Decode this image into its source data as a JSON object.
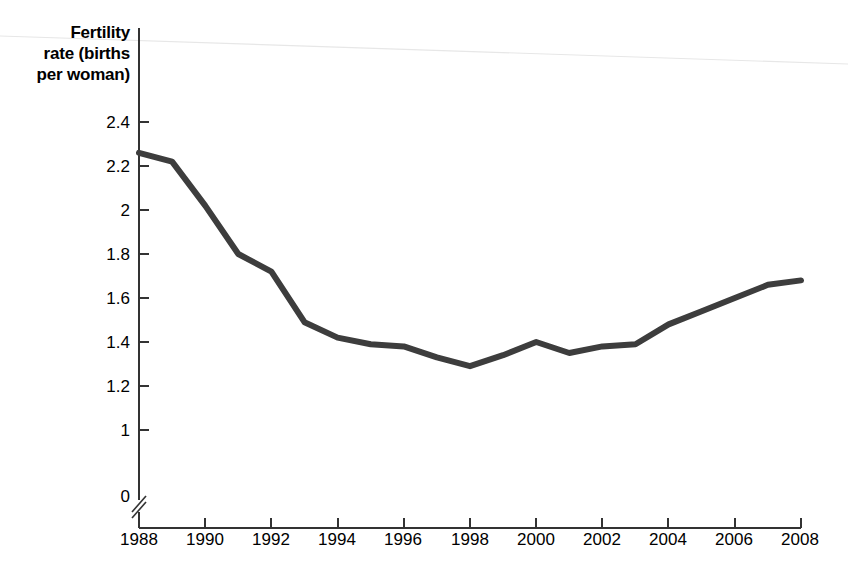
{
  "chart_data": {
    "type": "line",
    "title": "",
    "subtitle": "",
    "xlabel": "",
    "ylabel": "Fertility rate (births per woman)",
    "ylabel_lines": [
      "Fertility",
      "rate (births",
      "per woman)"
    ],
    "x": [
      1988,
      1989,
      1990,
      1991,
      1992,
      1993,
      1994,
      1995,
      1996,
      1997,
      1998,
      1999,
      2000,
      2001,
      2002,
      2003,
      2004,
      2005,
      2006,
      2007,
      2008
    ],
    "values": [
      2.26,
      2.22,
      2.02,
      1.8,
      1.72,
      1.49,
      1.42,
      1.39,
      1.38,
      1.33,
      1.29,
      1.34,
      1.4,
      1.35,
      1.38,
      1.39,
      1.48,
      1.54,
      1.6,
      1.66,
      1.68
    ],
    "series": [
      {
        "name": "Fertility rate",
        "values": [
          2.26,
          2.22,
          2.02,
          1.8,
          1.72,
          1.49,
          1.42,
          1.39,
          1.38,
          1.33,
          1.29,
          1.34,
          1.4,
          1.35,
          1.38,
          1.39,
          1.48,
          1.54,
          1.6,
          1.66,
          1.68
        ],
        "color": "#3d3d3d"
      }
    ],
    "ylim": [
      1.0,
      2.4
    ],
    "xlim": [
      1988,
      2008
    ],
    "y_ticks": [
      2.4,
      2.2,
      2.0,
      1.8,
      1.6,
      1.4,
      1.2,
      1.0
    ],
    "y_tick_labels": [
      "2.4",
      "2.2",
      "2",
      "1.8",
      "1.6",
      "1.4",
      "1.2",
      "1"
    ],
    "y_zero_label": "0",
    "y_axis_break": true,
    "x_ticks": [
      1988,
      1990,
      1992,
      1994,
      1996,
      1998,
      2000,
      2002,
      2004,
      2006,
      2008
    ],
    "x_tick_labels": [
      "1988",
      "1990",
      "1992",
      "1994",
      "1996",
      "1998",
      "2000",
      "2002",
      "2004",
      "2006",
      "2008"
    ],
    "grid": false,
    "legend": "none",
    "annotations": []
  },
  "style": {
    "line_color": "#3d3d3d",
    "axis_color": "#333333",
    "text_color": "#000000",
    "background": "#ffffff"
  }
}
